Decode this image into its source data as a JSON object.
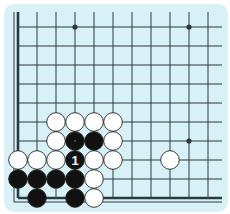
{
  "diagram": {
    "type": "go-board-fragment",
    "colors": {
      "background": "#d8f1f6",
      "line": "#2b3a40",
      "black_stone": "#111111",
      "white_stone": "#ffffff",
      "stone_outline": "#222222",
      "move_label": "#ffffff"
    },
    "grid": {
      "origin_x": 18,
      "origin_y": 27,
      "spacing": 19,
      "columns": 11,
      "rows": 10,
      "edges": [
        "left",
        "bottom"
      ]
    },
    "hoshi": [
      {
        "col": 3,
        "row": 0
      },
      {
        "col": 9,
        "row": 0
      },
      {
        "col": 9,
        "row": 6
      },
      {
        "col": 3,
        "row": 6
      }
    ],
    "stones": [
      {
        "color": "white",
        "col": 2,
        "row": 5
      },
      {
        "color": "white",
        "col": 3,
        "row": 5
      },
      {
        "color": "white",
        "col": 4,
        "row": 5
      },
      {
        "color": "white",
        "col": 5,
        "row": 5
      },
      {
        "color": "white",
        "col": 2,
        "row": 6
      },
      {
        "color": "black",
        "col": 3,
        "row": 6,
        "marker": "dot"
      },
      {
        "color": "black",
        "col": 4,
        "row": 6
      },
      {
        "color": "white",
        "col": 5,
        "row": 6
      },
      {
        "color": "white",
        "col": 0,
        "row": 7
      },
      {
        "color": "white",
        "col": 1,
        "row": 7
      },
      {
        "color": "white",
        "col": 2,
        "row": 7
      },
      {
        "color": "black",
        "col": 3,
        "row": 7,
        "label": "1"
      },
      {
        "color": "white",
        "col": 4,
        "row": 7
      },
      {
        "color": "white",
        "col": 5,
        "row": 7
      },
      {
        "color": "white",
        "col": 8,
        "row": 7
      },
      {
        "color": "black",
        "col": 0,
        "row": 8
      },
      {
        "color": "black",
        "col": 1,
        "row": 8
      },
      {
        "color": "black",
        "col": 2,
        "row": 8
      },
      {
        "color": "black",
        "col": 3,
        "row": 8
      },
      {
        "color": "white",
        "col": 4,
        "row": 8
      },
      {
        "color": "black",
        "col": 1,
        "row": 9
      },
      {
        "color": "black",
        "col": 3,
        "row": 9
      },
      {
        "color": "white",
        "col": 4,
        "row": 9
      }
    ],
    "move_labels": [
      "1"
    ]
  }
}
